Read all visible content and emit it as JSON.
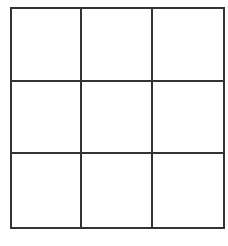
{
  "game": {
    "type": "tic-tac-toe",
    "rows": 3,
    "cols": 3,
    "line_color": "#333333",
    "background": "#ffffff",
    "board": [
      [
        "",
        "",
        ""
      ],
      [
        "",
        "",
        ""
      ],
      [
        "",
        "",
        ""
      ]
    ]
  }
}
